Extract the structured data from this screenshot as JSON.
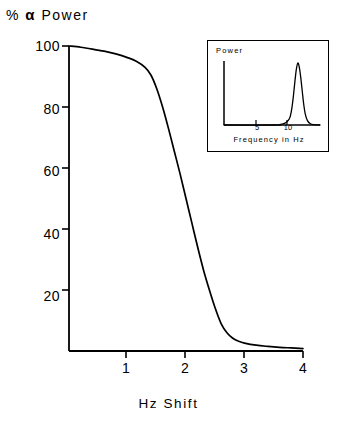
{
  "chart_data": {
    "type": "line",
    "title": "% α Power",
    "xlabel": "Hz Shift",
    "ylabel": "% α Power",
    "xlim": [
      0,
      4
    ],
    "ylim": [
      0,
      100
    ],
    "grid": false,
    "legend": "none",
    "xticks": [
      1,
      2,
      3,
      4
    ],
    "xtick_labels": [
      "1",
      "2",
      "3",
      "4"
    ],
    "yticks": [
      20,
      40,
      60,
      80,
      100
    ],
    "ytick_labels": [
      "20",
      "40",
      "60",
      "80",
      "100"
    ],
    "x": [
      0.0,
      0.2,
      0.4,
      0.6,
      0.8,
      1.0,
      1.15,
      1.3,
      1.4,
      1.5,
      1.6,
      1.7,
      1.8,
      1.9,
      2.0,
      2.1,
      2.2,
      2.3,
      2.4,
      2.5,
      2.6,
      2.7,
      2.8,
      2.9,
      3.0,
      3.2,
      3.4,
      3.6,
      3.8,
      4.0
    ],
    "y": [
      100.0,
      99.6,
      99.0,
      98.3,
      97.4,
      96.2,
      95.0,
      93.0,
      90.5,
      86.0,
      80.0,
      73.0,
      65.5,
      58.0,
      50.0,
      42.0,
      34.0,
      26.5,
      20.0,
      14.0,
      9.0,
      6.0,
      4.2,
      3.2,
      2.6,
      1.9,
      1.5,
      1.2,
      1.0,
      0.8
    ],
    "series": [
      {
        "name": "% alpha power vs Hz shift",
        "values": [
          100.0,
          99.6,
          99.0,
          98.3,
          97.4,
          96.2,
          95.0,
          93.0,
          90.5,
          86.0,
          80.0,
          73.0,
          65.5,
          58.0,
          50.0,
          42.0,
          34.0,
          26.5,
          20.0,
          14.0,
          9.0,
          6.0,
          4.2,
          3.2,
          2.6,
          1.9,
          1.5,
          1.2,
          1.0,
          0.8
        ]
      }
    ],
    "line_color": "#000000",
    "inset": {
      "type": "line",
      "ylabel": "Power",
      "xlabel": "Frequency in Hz",
      "xticks": [
        5,
        10
      ],
      "xtick_labels": [
        "5",
        "10"
      ],
      "xlim": [
        0,
        13
      ],
      "ylim": [
        0,
        1
      ],
      "peak_center_hz": 10,
      "x": [
        0.0,
        7.0,
        7.6,
        8.0,
        8.4,
        8.8,
        9.0,
        9.2,
        9.4,
        9.6,
        9.8,
        10.0,
        10.2,
        10.4,
        10.6,
        10.8,
        11.0,
        11.3,
        11.7,
        12.2,
        13.0
      ],
      "y": [
        0.0,
        0.0,
        0.01,
        0.02,
        0.04,
        0.09,
        0.15,
        0.28,
        0.47,
        0.7,
        0.9,
        1.0,
        0.93,
        0.76,
        0.54,
        0.33,
        0.18,
        0.07,
        0.02,
        0.005,
        0.0
      ],
      "line_color": "#000000"
    }
  },
  "axis_title": {
    "percent": "%",
    "alpha": "α",
    "word": "Power"
  },
  "x_axis_title": "Hz Shift"
}
